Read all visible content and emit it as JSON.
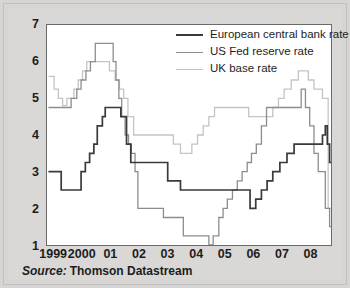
{
  "source": {
    "label": "Source:",
    "value": "Thomson Datastream"
  },
  "colors": {
    "ecb": "#3a3a3a",
    "usfed": "#8d8d8d",
    "uk": "#c4c4c4",
    "axis": "#6a6a6a",
    "text": "#1d1d1d",
    "background": "#d9d8d6",
    "plot_background": "#ffffff"
  },
  "chart_data": {
    "type": "line",
    "title": "",
    "subtitle": "",
    "xlabel": "",
    "ylabel": "",
    "grid": false,
    "step": "post",
    "legend_position": "top-right",
    "xlim": [
      1998.75,
      2008.75
    ],
    "ylim": [
      1,
      7
    ],
    "yticks": [
      1,
      2,
      3,
      4,
      5,
      6,
      7
    ],
    "ytick_labels": [
      "1",
      "2",
      "3",
      "4",
      "5",
      "6",
      "7"
    ],
    "xticks": [
      1999,
      2000,
      2001,
      2002,
      2003,
      2004,
      2005,
      2006,
      2007,
      2008
    ],
    "xtick_labels": [
      "1999",
      "2000",
      "01",
      "02",
      "03",
      "04",
      "05",
      "06",
      "07",
      "08"
    ],
    "series": [
      {
        "name": "European central bank rate",
        "color": "#3a3a3a",
        "x": [
          1998.8,
          1999.2,
          1999.25,
          1999.85,
          1999.95,
          2000.1,
          2000.25,
          2000.4,
          2000.52,
          2000.7,
          2000.8,
          2001.2,
          2001.35,
          2001.55,
          2001.7,
          2001.85,
          2002.75,
          2003.0,
          2003.45,
          2005.9,
          2006.1,
          2006.3,
          2006.5,
          2006.7,
          2006.95,
          2007.2,
          2007.45,
          2008.45,
          2008.55,
          2008.62,
          2008.7
        ],
        "y": [
          3.0,
          3.0,
          2.5,
          2.5,
          3.0,
          3.25,
          3.5,
          3.75,
          4.25,
          4.5,
          4.75,
          4.75,
          4.5,
          3.75,
          3.25,
          3.25,
          3.25,
          2.75,
          2.5,
          2.0,
          2.25,
          2.5,
          2.75,
          3.0,
          3.25,
          3.5,
          3.75,
          4.0,
          4.25,
          3.75,
          3.25
        ]
      },
      {
        "name": "US Fed reserve rate",
        "color": "#8d8d8d",
        "x": [
          1998.8,
          1999.45,
          1999.6,
          1999.8,
          1999.95,
          2000.12,
          2000.28,
          2000.45,
          2001.0,
          2001.08,
          2001.18,
          2001.28,
          2001.38,
          2001.5,
          2001.62,
          2001.72,
          2001.85,
          2001.95,
          2002.85,
          2003.55,
          2004.45,
          2004.6,
          2004.8,
          2004.95,
          2005.1,
          2005.28,
          2005.45,
          2005.62,
          2005.8,
          2005.95,
          2006.12,
          2006.3,
          2006.48,
          2007.7,
          2007.85,
          2008.0,
          2008.15,
          2008.3,
          2008.55,
          2008.7
        ],
        "y": [
          4.75,
          4.75,
          5.0,
          5.25,
          5.5,
          5.75,
          6.0,
          6.5,
          6.5,
          6.0,
          5.5,
          5.0,
          4.5,
          4.0,
          3.75,
          3.5,
          3.0,
          2.0,
          1.75,
          1.25,
          1.0,
          1.25,
          1.75,
          2.0,
          2.25,
          2.5,
          2.75,
          3.0,
          3.25,
          3.5,
          3.75,
          4.25,
          4.75,
          5.25,
          4.75,
          4.25,
          3.5,
          3.0,
          2.0,
          1.5
        ]
      },
      {
        "name": "UK base rate",
        "color": "#c4c4c4",
        "x": [
          1998.8,
          1999.0,
          1999.15,
          1999.3,
          1999.45,
          1999.7,
          1999.85,
          2000.0,
          2000.15,
          2000.75,
          2000.95,
          2001.15,
          2001.3,
          2001.45,
          2001.6,
          2001.8,
          2002.85,
          2003.2,
          2003.45,
          2003.85,
          2004.05,
          2004.25,
          2004.45,
          2004.65,
          2005.65,
          2005.85,
          2006.7,
          2006.9,
          2007.1,
          2007.35,
          2007.6,
          2007.95,
          2008.15,
          2008.45,
          2008.65
        ],
        "y": [
          5.6,
          5.25,
          5.0,
          4.8,
          5.0,
          5.25,
          5.5,
          5.75,
          6.0,
          6.0,
          5.75,
          5.5,
          5.25,
          5.0,
          4.5,
          4.0,
          4.0,
          3.75,
          3.5,
          3.75,
          4.0,
          4.25,
          4.5,
          4.75,
          4.75,
          4.5,
          4.75,
          5.0,
          5.25,
          5.5,
          5.75,
          5.5,
          5.25,
          5.0,
          2.0
        ]
      }
    ]
  },
  "legend": {
    "items": [
      {
        "label": "European central bank rate",
        "color": "#3a3a3a"
      },
      {
        "label": "US Fed reserve rate",
        "color": "#8d8d8d"
      },
      {
        "label": "UK base rate",
        "color": "#c4c4c4"
      }
    ]
  }
}
